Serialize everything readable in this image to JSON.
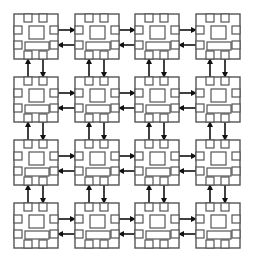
{
  "diagram": {
    "type": "mesh-network",
    "rows": 4,
    "cols": 4,
    "chip": {
      "width": 44,
      "height": 45
    },
    "col_x": [
      14,
      75,
      135,
      196
    ],
    "row_y": [
      14,
      77,
      140,
      203
    ],
    "colors": {
      "chip_stroke": "#555555",
      "arrow": "#111111",
      "background": "#ffffff"
    },
    "horizontal_links": {
      "upper_direction": "right",
      "lower_direction": "left"
    },
    "vertical_links": {
      "left_direction": "up",
      "right_direction": "down"
    },
    "node_label": "processing-node"
  }
}
